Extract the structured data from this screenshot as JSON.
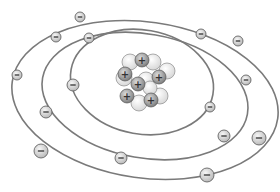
{
  "diagram": {
    "colors": {
      "background": "#ffffff",
      "orbit": "#7a7a7a",
      "electron_fill_light": "#f2f2f2",
      "electron_fill_dark": "#bdbdbd",
      "electron_stroke": "#555555",
      "proton_fill_light": "#d8d8d8",
      "proton_fill_dark": "#7d7d7d",
      "neutron_fill_light": "#ffffff",
      "neutron_fill_dark": "#d0d0d0",
      "sign": "#333333"
    },
    "orbits": [
      {
        "name": "inner-orbit",
        "cx": 142,
        "cy": 82,
        "rx": 72,
        "ry": 52,
        "rotate": 10
      },
      {
        "name": "middle-orbit",
        "cx": 145,
        "cy": 96,
        "rx": 104,
        "ry": 62,
        "rotate": 10
      },
      {
        "name": "outer-orbit",
        "cx": 145,
        "cy": 100,
        "rx": 134,
        "ry": 78,
        "rotate": 8
      }
    ],
    "electrons": [
      {
        "x": 80,
        "y": 17,
        "r": 5,
        "sign": "−",
        "orbit": "outer"
      },
      {
        "x": 56,
        "y": 37,
        "r": 5,
        "sign": "−",
        "orbit": "outer"
      },
      {
        "x": 17,
        "y": 75,
        "r": 5,
        "sign": "−",
        "orbit": "outer"
      },
      {
        "x": 41,
        "y": 151,
        "r": 7,
        "sign": "−",
        "orbit": "outer"
      },
      {
        "x": 207,
        "y": 175,
        "r": 7,
        "sign": "−",
        "orbit": "outer"
      },
      {
        "x": 259,
        "y": 138,
        "r": 7,
        "sign": "−",
        "orbit": "outer"
      },
      {
        "x": 238,
        "y": 41,
        "r": 5,
        "sign": "−",
        "orbit": "outer"
      },
      {
        "x": 89,
        "y": 38,
        "r": 5,
        "sign": "−",
        "orbit": "middle"
      },
      {
        "x": 201,
        "y": 34,
        "r": 5,
        "sign": "−",
        "orbit": "middle"
      },
      {
        "x": 246,
        "y": 80,
        "r": 5,
        "sign": "−",
        "orbit": "middle"
      },
      {
        "x": 224,
        "y": 136,
        "r": 6,
        "sign": "−",
        "orbit": "middle"
      },
      {
        "x": 121,
        "y": 158,
        "r": 6,
        "sign": "−",
        "orbit": "middle"
      },
      {
        "x": 46,
        "y": 112,
        "r": 6,
        "sign": "−",
        "orbit": "middle"
      },
      {
        "x": 73,
        "y": 85,
        "r": 6,
        "sign": "−",
        "orbit": "inner"
      },
      {
        "x": 210,
        "y": 107,
        "r": 5,
        "sign": "−",
        "orbit": "inner"
      }
    ],
    "nucleus": {
      "neutrons": [
        {
          "x": 130,
          "y": 62,
          "r": 8
        },
        {
          "x": 153,
          "y": 62,
          "r": 8
        },
        {
          "x": 124,
          "y": 78,
          "r": 8
        },
        {
          "x": 167,
          "y": 71,
          "r": 8
        },
        {
          "x": 146,
          "y": 80,
          "r": 8
        },
        {
          "x": 160,
          "y": 96,
          "r": 8
        },
        {
          "x": 139,
          "y": 103,
          "r": 8
        },
        {
          "x": 150,
          "y": 88,
          "r": 7
        }
      ],
      "protons": [
        {
          "x": 142,
          "y": 60,
          "r": 7,
          "sign": "+"
        },
        {
          "x": 125,
          "y": 74,
          "r": 7,
          "sign": "+"
        },
        {
          "x": 159,
          "y": 77,
          "r": 7,
          "sign": "+"
        },
        {
          "x": 138,
          "y": 84,
          "r": 7,
          "sign": "+"
        },
        {
          "x": 127,
          "y": 96,
          "r": 7,
          "sign": "+"
        },
        {
          "x": 151,
          "y": 100,
          "r": 7,
          "sign": "+"
        }
      ]
    }
  }
}
